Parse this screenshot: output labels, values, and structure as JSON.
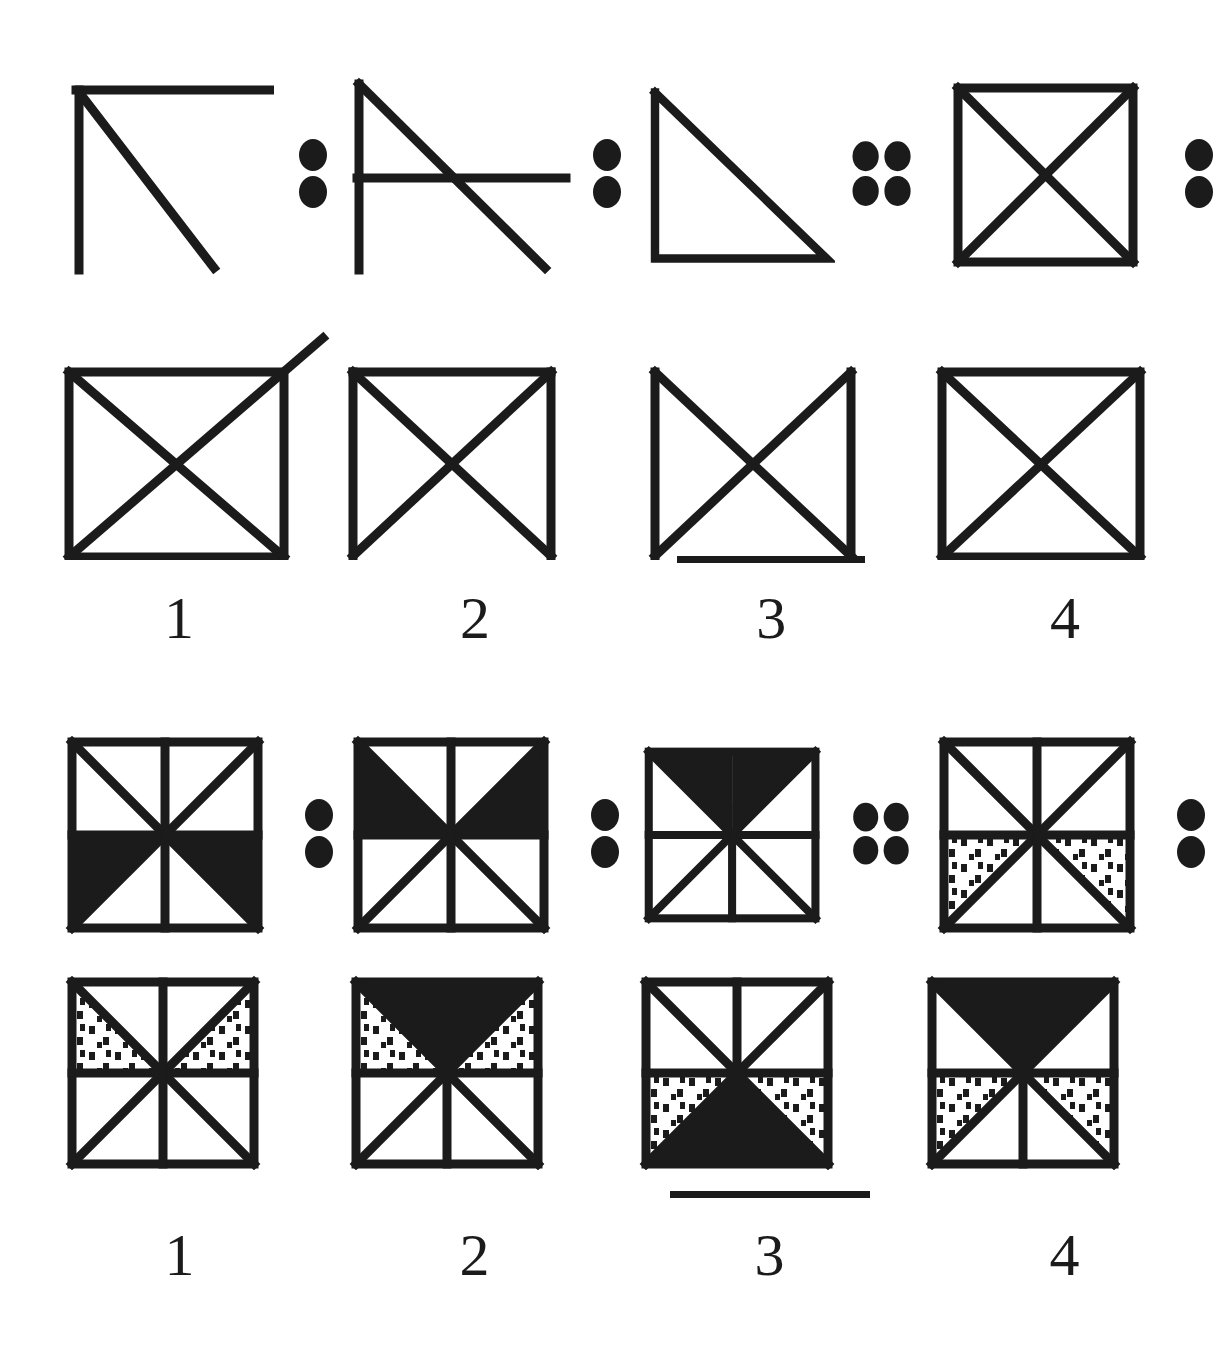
{
  "page": {
    "ink_color": "#1b1b1b",
    "background_color": "#ffffff"
  },
  "sections": [
    {
      "id": "section-top",
      "name": "simple-line-figures",
      "problem_row": {
        "items": [
          {
            "id": "t-p1",
            "figure": "corner-with-diagonal",
            "description": "vertical left line and horizontal top line meeting at top-left, with a diagonal from top-left going down-right past the bottom",
            "separator": {
              "type": "dots",
              "count": 2,
              "layout": "1x2"
            }
          },
          {
            "id": "t-p2",
            "figure": "vertical-diagonal-horizontal",
            "description": "vertical left line, diagonal from top-left down-right, and a horizontal line crossing at mid height",
            "separator": {
              "type": "dots",
              "count": 2,
              "layout": "1x2"
            }
          },
          {
            "id": "t-p3",
            "figure": "right-triangle",
            "description": "right triangle with vertical left edge, horizontal bottom edge and hypotenuse from top-left to bottom-right",
            "separator": {
              "type": "dots",
              "count": 4,
              "layout": "2x2"
            }
          },
          {
            "id": "t-p4",
            "figure": "square-with-x",
            "description": "full square with both diagonals forming an X",
            "separator": {
              "type": "dots",
              "count": 2,
              "layout": "1x2"
            }
          }
        ]
      },
      "answer_row": {
        "options": [
          {
            "number": "1",
            "figure": "square-with-x-and-overshoot",
            "description": "square with X where the anti-diagonal extends beyond the top-right corner",
            "selected": false
          },
          {
            "number": "2",
            "figure": "square-with-x-no-bottom-edge",
            "description": "square with X but missing the bottom edge",
            "selected": false
          },
          {
            "number": "3",
            "figure": "x-with-side-edges-only",
            "description": "X with left and right vertical edges only, no top or bottom edge",
            "selected": true
          },
          {
            "number": "4",
            "figure": "square-with-x",
            "description": "complete square with both diagonals",
            "selected": false
          }
        ]
      }
    },
    {
      "id": "section-bottom",
      "name": "eight-wedge-shaded-squares",
      "problem_row": {
        "items": [
          {
            "id": "b-p1",
            "figure": "eight-wedge-square",
            "black_wedges": [
              "left-lower",
              "right-lower"
            ],
            "dotted_wedges": [],
            "separator": {
              "type": "dots",
              "count": 2,
              "layout": "1x2"
            }
          },
          {
            "id": "b-p2",
            "figure": "eight-wedge-square",
            "black_wedges": [
              "left-upper",
              "right-upper"
            ],
            "dotted_wedges": [],
            "separator": {
              "type": "dots",
              "count": 2,
              "layout": "1x2"
            }
          },
          {
            "id": "b-p3",
            "figure": "eight-wedge-square",
            "black_wedges": [
              "top-left",
              "top-right"
            ],
            "dotted_wedges": [],
            "separator": {
              "type": "dots",
              "count": 4,
              "layout": "2x2"
            }
          },
          {
            "id": "b-p4",
            "figure": "eight-wedge-square",
            "black_wedges": [],
            "dotted_wedges": [
              "left-lower",
              "right-lower"
            ],
            "separator": {
              "type": "dots",
              "count": 2,
              "layout": "1x2"
            }
          }
        ]
      },
      "answer_row": {
        "options": [
          {
            "number": "1",
            "figure": "eight-wedge-square",
            "black_wedges": [],
            "dotted_wedges": [
              "left-upper",
              "right-upper"
            ],
            "selected": false
          },
          {
            "number": "2",
            "figure": "eight-wedge-square",
            "black_wedges": [
              "top-left",
              "top-right"
            ],
            "dotted_wedges": [
              "left-upper",
              "right-upper"
            ],
            "selected": false
          },
          {
            "number": "3",
            "figure": "eight-wedge-square",
            "black_wedges": [
              "bottom-left",
              "bottom-right"
            ],
            "dotted_wedges": [
              "left-lower",
              "right-lower"
            ],
            "selected": true
          },
          {
            "number": "4",
            "figure": "eight-wedge-square",
            "black_wedges": [
              "top-left",
              "top-right"
            ],
            "dotted_wedges": [
              "left-lower",
              "right-lower"
            ],
            "selected": false
          }
        ]
      }
    }
  ]
}
